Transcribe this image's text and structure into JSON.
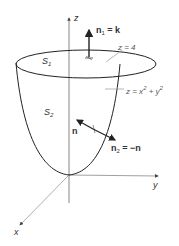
{
  "diagram": {
    "axes": {
      "z": "z",
      "y": "y",
      "x": "x"
    },
    "surfaces": {
      "top_disk": "S",
      "top_disk_sub": "1",
      "paraboloid": "S",
      "paraboloid_sub": "2"
    },
    "labels": {
      "n1_left": "n",
      "n1_sub": "1",
      "n1_right": " = k",
      "plane": "z = 4",
      "paraboloid_eq": "z = x",
      "paraboloid_eq_exp1": "2",
      "paraboloid_eq_mid": " + y",
      "paraboloid_eq_exp2": "2",
      "n": "n",
      "n2_left": "n",
      "n2_sub": "2",
      "n2_right": " = −n"
    },
    "colors": {
      "line": "#222222",
      "axis": "#555555",
      "leader": "#999999"
    }
  }
}
